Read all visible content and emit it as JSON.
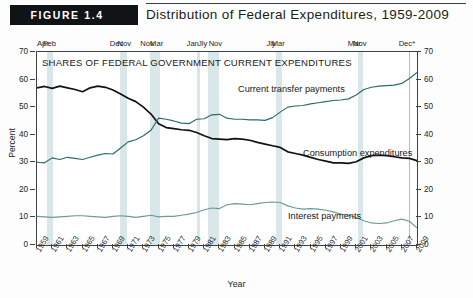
{
  "figure": {
    "badge": "FIGURE 1.4",
    "title": "Distribution of Federal Expenditures, 1959-2009",
    "plot_header": "SHARES OF FEDERAL GOVERNMENT CURRENT EXPENDITURES"
  },
  "colors": {
    "transfer": "#2e6a6d",
    "consumption": "#101314",
    "interest": "#6b9a9c",
    "recession_band": "#d3e3e4",
    "axis": "#3c4245",
    "badge_bg": "#111416"
  },
  "recession_markers": [
    {
      "label": "Apr",
      "year": 1960.3
    },
    {
      "label": "Feb",
      "year": 1961.1
    },
    {
      "label": "Dec",
      "year": 1969.9
    },
    {
      "label": "Nov",
      "year": 1970.9
    },
    {
      "label": "Nov",
      "year": 1973.9
    },
    {
      "label": "Mar",
      "year": 1975.2
    },
    {
      "label": "Jan",
      "year": 1980.0
    },
    {
      "label": "Jly",
      "year": 1981.5
    },
    {
      "label": "Nov",
      "year": 1982.9
    },
    {
      "label": "Jly",
      "year": 1990.5
    },
    {
      "label": "Mar",
      "year": 1991.2
    },
    {
      "label": "Mar",
      "year": 2001.2
    },
    {
      "label": "Nov",
      "year": 2001.9
    },
    {
      "label": "Dec*",
      "year": 2007.9
    }
  ],
  "recession_bands": [
    {
      "start": 1960.3,
      "end": 1961.1
    },
    {
      "start": 1969.9,
      "end": 1970.9
    },
    {
      "start": 1973.9,
      "end": 1975.2
    },
    {
      "start": 1980.0,
      "end": 1980.5
    },
    {
      "start": 1981.5,
      "end": 1982.9
    },
    {
      "start": 1990.5,
      "end": 1991.2
    },
    {
      "start": 2001.2,
      "end": 2001.9
    }
  ],
  "reference_line_year": 2007.9,
  "chart_data": {
    "type": "line",
    "title": "Distribution of Federal Expenditures, 1959-2009",
    "subtitle": "SHARES OF FEDERAL GOVERNMENT CURRENT EXPENDITURES",
    "xlabel": "Year",
    "ylabel": "Percent",
    "xlim": [
      1959,
      2009
    ],
    "ylim": [
      0,
      70
    ],
    "yticks": [
      0,
      10,
      20,
      30,
      40,
      50,
      60,
      70
    ],
    "xticks": [
      1959,
      1961,
      1963,
      1965,
      1967,
      1969,
      1971,
      1973,
      1975,
      1977,
      1979,
      1981,
      1983,
      1985,
      1987,
      1989,
      1991,
      1993,
      1995,
      1997,
      1999,
      2001,
      2003,
      2005,
      2007,
      2009
    ],
    "grid": false,
    "legend_position": "inline-annotations",
    "x": [
      1959,
      1960,
      1961,
      1962,
      1963,
      1964,
      1965,
      1966,
      1967,
      1968,
      1969,
      1970,
      1971,
      1972,
      1973,
      1974,
      1975,
      1976,
      1977,
      1978,
      1979,
      1980,
      1981,
      1982,
      1983,
      1984,
      1985,
      1986,
      1987,
      1988,
      1989,
      1990,
      1991,
      1992,
      1993,
      1994,
      1995,
      1996,
      1997,
      1998,
      1999,
      2000,
      2001,
      2002,
      2003,
      2004,
      2005,
      2006,
      2007,
      2008,
      2009
    ],
    "series": [
      {
        "name": "Consumption expenditures",
        "color": "#101314",
        "values": [
          57.0,
          57.5,
          56.8,
          57.6,
          57.0,
          56.4,
          55.6,
          57.0,
          57.6,
          57.2,
          56.2,
          54.8,
          53.2,
          52.0,
          50.0,
          47.5,
          44.0,
          42.6,
          42.2,
          41.8,
          41.6,
          40.8,
          39.6,
          38.6,
          38.4,
          38.2,
          38.6,
          38.4,
          38.0,
          37.2,
          36.6,
          36.0,
          35.4,
          33.8,
          33.2,
          32.6,
          31.8,
          31.0,
          30.4,
          29.8,
          29.8,
          29.6,
          30.2,
          31.6,
          32.4,
          32.6,
          32.4,
          32.0,
          31.6,
          31.4,
          30.6
        ]
      },
      {
        "name": "Current transfer payments",
        "color": "#2e6a6d",
        "values": [
          30.0,
          29.8,
          31.6,
          31.0,
          31.8,
          31.4,
          31.0,
          31.8,
          32.6,
          33.2,
          33.0,
          35.2,
          37.4,
          38.2,
          39.6,
          41.6,
          46.0,
          45.6,
          45.0,
          44.2,
          44.0,
          45.6,
          45.8,
          47.2,
          47.4,
          46.0,
          45.6,
          45.6,
          45.4,
          45.4,
          45.2,
          46.2,
          48.2,
          50.0,
          50.4,
          50.6,
          51.2,
          51.6,
          52.0,
          52.4,
          52.6,
          53.0,
          54.4,
          56.4,
          57.2,
          57.6,
          57.8,
          58.0,
          58.6,
          60.4,
          62.6
        ]
      },
      {
        "name": "Interest payments",
        "color": "#6b9a9c",
        "values": [
          10.4,
          10.2,
          10.0,
          10.2,
          10.4,
          10.6,
          10.6,
          10.4,
          10.2,
          10.0,
          10.4,
          10.6,
          10.4,
          10.0,
          10.4,
          10.8,
          10.2,
          10.4,
          10.4,
          10.8,
          11.2,
          11.8,
          12.8,
          13.4,
          13.2,
          14.6,
          15.0,
          14.8,
          14.6,
          15.0,
          15.4,
          15.6,
          15.4,
          14.2,
          13.4,
          13.0,
          13.2,
          13.0,
          12.6,
          12.0,
          11.2,
          10.8,
          10.0,
          8.8,
          8.0,
          7.8,
          8.0,
          8.8,
          9.4,
          8.6,
          6.2
        ]
      }
    ]
  }
}
